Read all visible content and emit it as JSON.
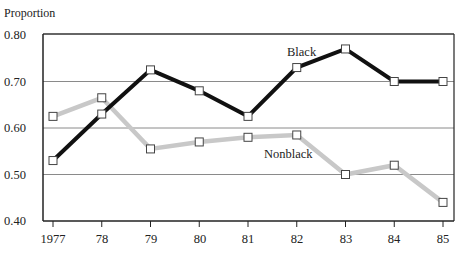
{
  "chart_data": {
    "type": "line",
    "title": "",
    "xlabel": "",
    "ylabel": "Proportion",
    "categories": [
      "1977",
      "78",
      "79",
      "80",
      "81",
      "82",
      "83",
      "84",
      "85"
    ],
    "x": [
      1977,
      1978,
      1979,
      1980,
      1981,
      1982,
      1983,
      1984,
      1985
    ],
    "yticks": [
      "0.80",
      "0.70",
      "0.60",
      "0.50",
      "0.40"
    ],
    "ylim": [
      0.4,
      0.8
    ],
    "grid": true,
    "legend": "inline labels",
    "series": [
      {
        "name": "Black",
        "color": "#111111",
        "marker": "open-square",
        "values": [
          0.53,
          0.63,
          0.725,
          0.68,
          0.625,
          0.73,
          0.77,
          0.7,
          0.7
        ]
      },
      {
        "name": "Nonblack",
        "color": "#c8c8c8",
        "marker": "open-square",
        "values": [
          0.625,
          0.665,
          0.555,
          0.57,
          0.58,
          0.585,
          0.5,
          0.52,
          0.44
        ]
      }
    ],
    "annotations": [
      {
        "text": "Black",
        "near": "1982-1983"
      },
      {
        "text": "Nonblack",
        "near": "1982"
      }
    ]
  }
}
